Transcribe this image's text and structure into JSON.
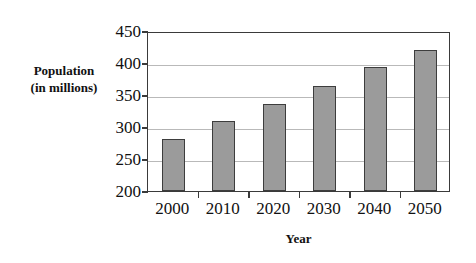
{
  "chart_data": {
    "type": "bar",
    "title": "",
    "xlabel": "Year",
    "ylabel_line1": "Population",
    "ylabel_line2": "(in millions)",
    "categories": [
      "2000",
      "2010",
      "2020",
      "2030",
      "2040",
      "2050"
    ],
    "values": [
      281,
      309,
      336,
      364,
      393,
      421
    ],
    "ylim": [
      200,
      450
    ],
    "yticks": [
      "450",
      "400",
      "350",
      "300",
      "250",
      "200"
    ],
    "ytick_values": [
      450,
      400,
      350,
      300,
      250,
      200
    ],
    "grid": true,
    "legend": "none",
    "bar_fill_color": "#9b9b9b",
    "bar_border_color": "#3d3d3d",
    "gridline_color": "#b9b9b9",
    "axis_color": "#3a3a3a",
    "background_color": "#ffffff"
  }
}
